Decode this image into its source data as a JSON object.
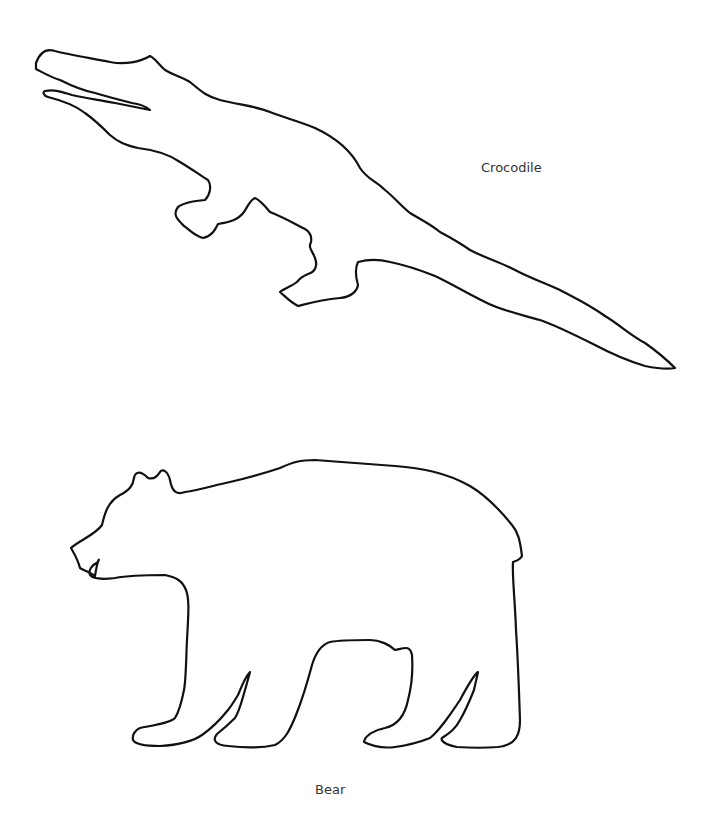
{
  "figures": [
    {
      "name": "crocodile",
      "label": "Crocodile"
    },
    {
      "name": "bear",
      "label": "Bear"
    }
  ],
  "colors": {
    "background": "#ffffff",
    "outline": "#111111",
    "label_text": "#333333"
  }
}
